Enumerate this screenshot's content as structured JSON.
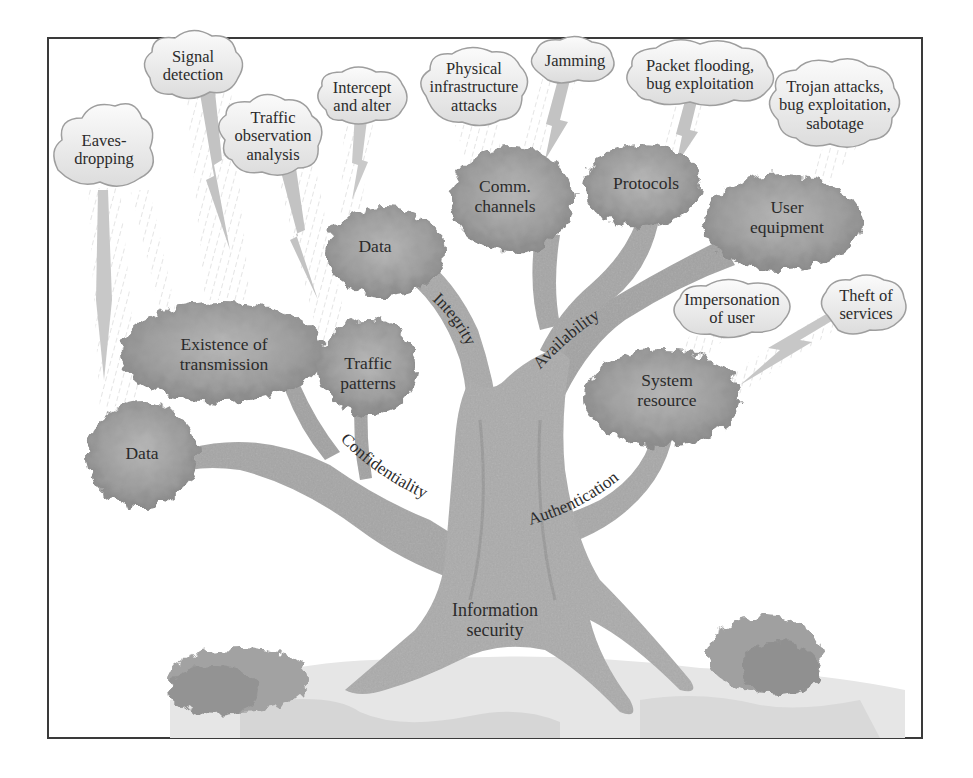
{
  "diagram": {
    "root": {
      "label_line1": "Information",
      "label_line2": "security"
    },
    "branches": [
      {
        "id": "confidentiality",
        "label": "Confidentiality"
      },
      {
        "id": "integrity",
        "label": "Integrity"
      },
      {
        "id": "availability",
        "label": "Availability"
      },
      {
        "id": "authentication",
        "label": "Authentication"
      }
    ],
    "assets": {
      "conf_data": {
        "line1": "Data",
        "line2": ""
      },
      "existence": {
        "line1": "Existence of",
        "line2": "transmission"
      },
      "traffic_patterns": {
        "line1": "Traffic",
        "line2": "patterns"
      },
      "integ_data": {
        "line1": "Data",
        "line2": ""
      },
      "comm_channels": {
        "line1": "Comm.",
        "line2": "channels"
      },
      "protocols": {
        "line1": "Protocols",
        "line2": ""
      },
      "user_equipment": {
        "line1": "User",
        "line2": "equipment"
      },
      "system_resource": {
        "line1": "System",
        "line2": "resource"
      }
    },
    "threats": {
      "eavesdropping": {
        "line1": "Eaves-",
        "line2": "dropping",
        "line3": ""
      },
      "signal_detection": {
        "line1": "Signal",
        "line2": "detection",
        "line3": ""
      },
      "traffic_observation": {
        "line1": "Traffic",
        "line2": "observation",
        "line3": "analysis"
      },
      "intercept_alter": {
        "line1": "Intercept",
        "line2": "and alter",
        "line3": ""
      },
      "physical_infra": {
        "line1": "Physical",
        "line2": "infrastructure",
        "line3": "attacks"
      },
      "jamming": {
        "line1": "Jamming",
        "line2": "",
        "line3": ""
      },
      "packet_flooding": {
        "line1": "Packet flooding,",
        "line2": "bug exploitation",
        "line3": ""
      },
      "trojan": {
        "line1": "Trojan attacks,",
        "line2": "bug exploitation,",
        "line3": "sabotage"
      },
      "impersonation": {
        "line1": "Impersonation",
        "line2": "of user",
        "line3": ""
      },
      "theft": {
        "line1": "Theft of",
        "line2": "services",
        "line3": ""
      }
    },
    "colors": {
      "frame": "#3a3a3a",
      "trunk": "#a9a9a9",
      "trunk_dark": "#8f8f8f",
      "foliage": "#9a9a9a",
      "foliage_light": "#c4c4c4",
      "cloud_fill": "#f4f4f4",
      "cloud_stroke": "#9e9e9e",
      "bolt": "#bdbdbd",
      "ground": "#e2e2e2",
      "text": "#2b2b2b"
    }
  }
}
